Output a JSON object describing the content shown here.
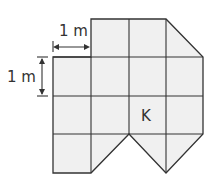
{
  "diagram": {
    "labels": {
      "horizontal_dimension": "1 m",
      "vertical_dimension": "1 m",
      "cell_marker": "K"
    },
    "unit_square_side": "1 m",
    "colors": {
      "fill": "#f0f0f0",
      "stroke": "#333333",
      "background": "#ffffff"
    },
    "shape": {
      "description": "Polygon composed of unit grid squares and half-square triangles",
      "grid_columns": 4,
      "grid_rows": 4,
      "marked_cell": {
        "row": 3,
        "column": 3,
        "label": "K"
      }
    }
  }
}
